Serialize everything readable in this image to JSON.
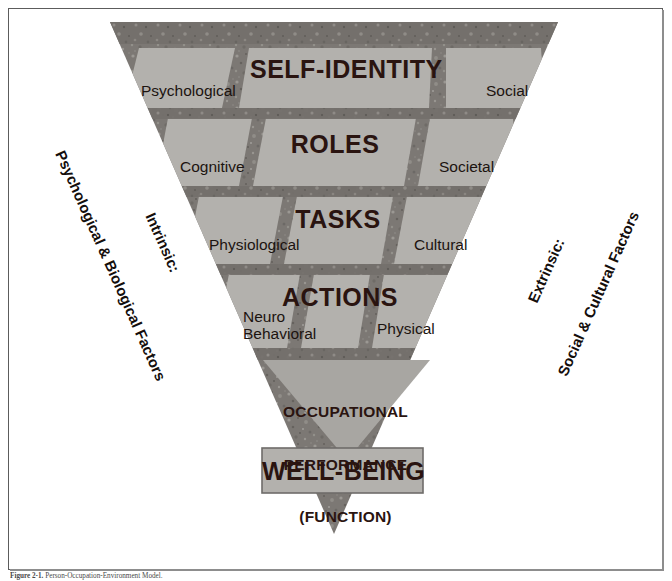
{
  "figure": {
    "caption_number": "Figure 2-1.",
    "caption_text": "Person-Occupation-Environment Model.",
    "frame_color": "#5c5c5c",
    "background_color": "#ffffff"
  },
  "diagram": {
    "title_hidden": "Inverted pyramid of occupational performance",
    "texture_color": "#7e7a76",
    "cell_color": "#b3b1ad",
    "inner_triangle_color": "#a8a6a2",
    "text_color": "#2a1410",
    "tiers": [
      {
        "id": "tier-self-identity",
        "title": "SELF-IDENTITY",
        "left_label": "Psychological",
        "right_label": "Social"
      },
      {
        "id": "tier-roles",
        "title": "ROLES",
        "left_label": "Cognitive",
        "right_label": "Societal"
      },
      {
        "id": "tier-tasks",
        "title": "TASKS",
        "left_label": "Physiological",
        "right_label": "Cultural"
      },
      {
        "id": "tier-actions",
        "title": "ACTIONS",
        "left_label": "Neuro\nBehavioral",
        "right_label": "Physical"
      }
    ],
    "inner_triangle": {
      "line1": "OCCUPATIONAL",
      "line2": "PERFORMANCE",
      "line3": "(FUNCTION)"
    },
    "outcome_box": {
      "label": "WELL-BEING",
      "fill": "#b3b1ad",
      "border": "#6e6c69"
    },
    "left_axis": {
      "line1": "Intrinsic:",
      "line2": "Psychological & Biological Factors"
    },
    "right_axis": {
      "line1": "Extrinsic:",
      "line2": "Social & Cultural Factors"
    }
  }
}
